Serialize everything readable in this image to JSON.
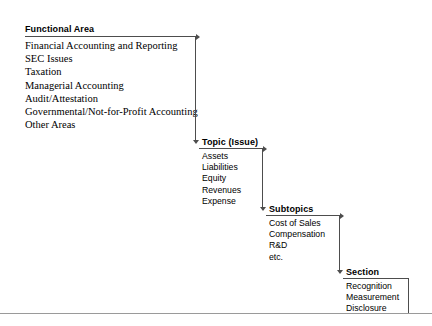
{
  "figure": {
    "type": "hierarchy-cascade-diagram",
    "line_color": "#4d4d4d",
    "rule_color": "#9a9a9a",
    "text_color": "#000000",
    "background": "#ffffff"
  },
  "levels": [
    {
      "id": "functional-area",
      "heading": "Functional Area",
      "items": [
        "Financial Accounting and Reporting",
        "SEC Issues",
        "Taxation",
        "Managerial Accounting",
        "Audit/Attestation",
        "Governmental/Not-for-Profit Accounting",
        "Other Areas"
      ]
    },
    {
      "id": "topic-issue",
      "heading": "Topic (Issue)",
      "items": [
        "Assets",
        "Liabilities",
        "Equity",
        "Revenues",
        "Expense"
      ]
    },
    {
      "id": "subtopics",
      "heading": "Subtopics",
      "items": [
        "Cost of Sales",
        "Compensation",
        "R&D",
        "etc."
      ]
    },
    {
      "id": "section",
      "heading": "Section",
      "items": [
        "Recognition",
        "Measurement",
        "Disclosure"
      ]
    }
  ]
}
